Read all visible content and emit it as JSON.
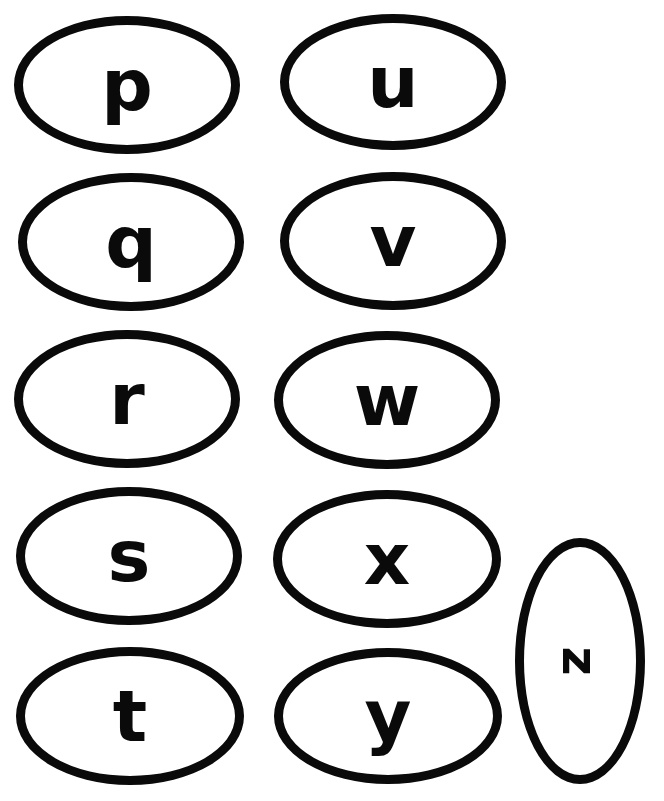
{
  "letters": [
    {
      "char": "p",
      "x": 14,
      "y": 16,
      "w": 226,
      "h": 138
    },
    {
      "char": "q",
      "x": 18,
      "y": 173,
      "w": 226,
      "h": 138
    },
    {
      "char": "r",
      "x": 14,
      "y": 330,
      "w": 226,
      "h": 138
    },
    {
      "char": "s",
      "x": 16,
      "y": 487,
      "w": 226,
      "h": 138
    },
    {
      "char": "t",
      "x": 16,
      "y": 647,
      "w": 228,
      "h": 138
    },
    {
      "char": "u",
      "x": 280,
      "y": 14,
      "w": 226,
      "h": 136
    },
    {
      "char": "v",
      "x": 280,
      "y": 172,
      "w": 226,
      "h": 138
    },
    {
      "char": "w",
      "x": 274,
      "y": 331,
      "w": 226,
      "h": 138
    },
    {
      "char": "x",
      "x": 273,
      "y": 490,
      "w": 228,
      "h": 138
    },
    {
      "char": "y",
      "x": 274,
      "y": 648,
      "w": 228,
      "h": 136
    },
    {
      "char": "z",
      "x": 515,
      "y": 538,
      "w": 130,
      "h": 246,
      "rotated": true
    }
  ],
  "colors": {
    "stroke": "#0a0a0a",
    "background": "#ffffff"
  }
}
